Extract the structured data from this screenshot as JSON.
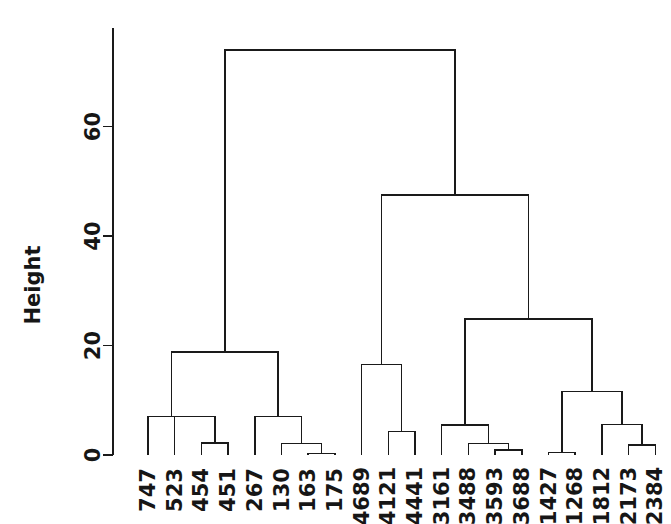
{
  "chart_data": {
    "type": "dendrogram",
    "title": "",
    "xlabel": "",
    "ylabel": "Height",
    "ylim": [
      0,
      78
    ],
    "yticks": [
      0,
      20,
      40,
      60
    ],
    "ytick_labels": [
      "0",
      "20",
      "40",
      "60"
    ],
    "grid": false,
    "legend": "none",
    "leaf_labels": [
      "747",
      "523",
      "454",
      "451",
      "267",
      "130",
      "163",
      "175",
      "4689",
      "4121",
      "4441",
      "3161",
      "3488",
      "3593",
      "3688",
      "1427",
      "1268",
      "1812",
      "2173",
      "2384"
    ],
    "leaf_order_index": [
      0,
      1,
      2,
      3,
      4,
      5,
      6,
      7,
      8,
      9,
      10,
      11,
      12,
      13,
      14,
      15,
      16,
      17,
      18,
      19
    ],
    "merges": [
      {
        "id": "m1",
        "left": "454",
        "right": "451",
        "height": 2.2
      },
      {
        "id": "m2",
        "left": "523",
        "right": "m1",
        "height": 7.0
      },
      {
        "id": "m3",
        "left": "747",
        "right": "m2",
        "height": 7.0
      },
      {
        "id": "m4",
        "left": "163",
        "right": "175",
        "height": 0.3
      },
      {
        "id": "m5",
        "left": "130",
        "right": "m4",
        "height": 2.1
      },
      {
        "id": "m6",
        "left": "267",
        "right": "m5",
        "height": 7.0
      },
      {
        "id": "m7",
        "left": "m3",
        "right": "m6",
        "height": 18.8
      },
      {
        "id": "m8",
        "left": "4121",
        "right": "4441",
        "height": 4.3
      },
      {
        "id": "m9",
        "left": "4689",
        "right": "m8",
        "height": 16.5
      },
      {
        "id": "m10",
        "left": "3593",
        "right": "3688",
        "height": 0.9
      },
      {
        "id": "m11",
        "left": "3488",
        "right": "m10",
        "height": 2.1
      },
      {
        "id": "m12",
        "left": "3161",
        "right": "m11",
        "height": 5.5
      },
      {
        "id": "m13",
        "left": "1427",
        "right": "1268",
        "height": 0.5
      },
      {
        "id": "m14",
        "left": "2173",
        "right": "2384",
        "height": 1.8
      },
      {
        "id": "m15",
        "left": "1812",
        "right": "m14",
        "height": 5.6
      },
      {
        "id": "m16",
        "left": "m13",
        "right": "m15",
        "height": 11.6
      },
      {
        "id": "m17",
        "left": "m12",
        "right": "m16",
        "height": 24.8
      },
      {
        "id": "m18",
        "left": "m9",
        "right": "m17",
        "height": 47.5
      },
      {
        "id": "m19",
        "left": "m7",
        "right": "m18",
        "height": 74.0
      }
    ]
  },
  "axis": {
    "y_title": "Height",
    "ticks": [
      {
        "value": 60,
        "label": "60"
      },
      {
        "value": 40,
        "label": "40"
      },
      {
        "value": 20,
        "label": "20"
      },
      {
        "value": 0,
        "label": "0"
      }
    ]
  },
  "colors": {
    "background": "#ffffff",
    "ink": "#1a1a1a",
    "text": "#161616"
  }
}
